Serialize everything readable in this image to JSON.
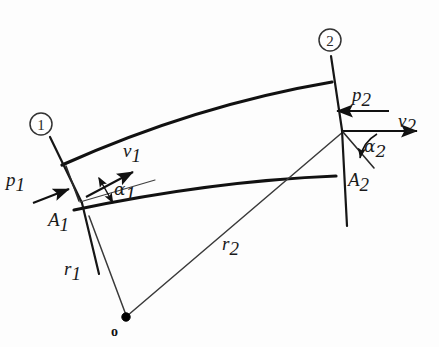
{
  "figure": {
    "kind": "engineering-diagram",
    "width": 439,
    "height": 347,
    "background_color": "#fdfdfd",
    "ink_color": "#111111"
  },
  "labels": {
    "section_one": "1",
    "section_two": "2",
    "pressure_one": "p",
    "pressure_one_sub": "1",
    "pressure_two": "p",
    "pressure_two_sub": "2",
    "velocity_one": "v",
    "velocity_one_sub": "1",
    "velocity_two": "v",
    "velocity_two_sub": "2",
    "angle_one": "α",
    "angle_one_sub": "1",
    "angle_two": "α",
    "angle_two_sub": "2",
    "area_one": "A",
    "area_one_sub": "1",
    "area_two": "A",
    "area_two_sub": "2",
    "radius_one": "r",
    "radius_one_sub": "1",
    "radius_two": "r",
    "radius_two_sub": "2",
    "origin": "o"
  },
  "geometry": {
    "origin_point": [
      125,
      318
    ],
    "outer_wall": "M 62 165 Q 195 106 331 82",
    "inner_wall": "M 74 209 Q 210 180 334 176",
    "section_line_one": "M 48 136 L 96 275",
    "section_line_one_lower": "M 48 136 L 96 275",
    "radius_line_one": "M 88 212 L 125 318",
    "radius_line_two": "M 128 316 L 342 131",
    "section_line_two": "M 331 55 L 344 225",
    "vertex_A1": [
      78,
      200
    ],
    "vertex_A2": [
      342,
      131
    ],
    "v1_vector": "M 88 196 L 134 172",
    "v2_vector": "M 344 131 L 416 131",
    "p1_vector": "M 36 202 L 68 190",
    "p2_vector": "M 386 111 L 336 111",
    "tangent_ray_one": "M 82 200 L 150 181",
    "tangent_two": "M 343 132 L 372 166",
    "alpha1_double_arrow": "M 98 180 L 114 205",
    "alpha2_arc": "M 372 135 A 33 33 0 0 0 357 157"
  },
  "values": {
    "section_one_number": "1",
    "section_two_number": "2"
  }
}
